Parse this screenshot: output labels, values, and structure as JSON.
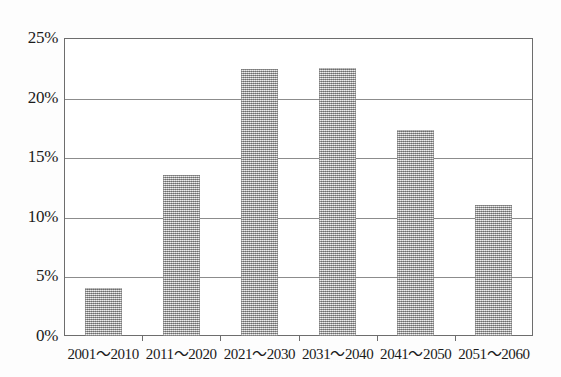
{
  "chart_data": {
    "type": "bar",
    "title": "",
    "subtitle": "",
    "xlabel": "",
    "ylabel": "",
    "categories": [
      "2001〜2010",
      "2011〜2020",
      "2021〜2030",
      "2031〜2040",
      "2041〜2050",
      "2051〜2060"
    ],
    "values": [
      4.0,
      13.5,
      22.4,
      22.5,
      17.3,
      11.0
    ],
    "series": [
      {
        "name": "",
        "values": [
          4.0,
          13.5,
          22.4,
          22.5,
          17.3,
          11.0
        ]
      }
    ],
    "ylim": [
      0,
      25
    ],
    "ytick_values": [
      0,
      5,
      10,
      15,
      20,
      25
    ],
    "ytick_labels": [
      "0%",
      "5%",
      "10%",
      "15%",
      "20%",
      "25%"
    ],
    "grid": true,
    "grid_axis": "y",
    "legend": false,
    "legend_position": "none",
    "bar_color": "#b0b0b0",
    "grid_color": "#8c8c8c",
    "frame_color": "#6d6d6d",
    "text_color": "#1b1b1b",
    "background_color": "#ffffff",
    "annotations": []
  }
}
